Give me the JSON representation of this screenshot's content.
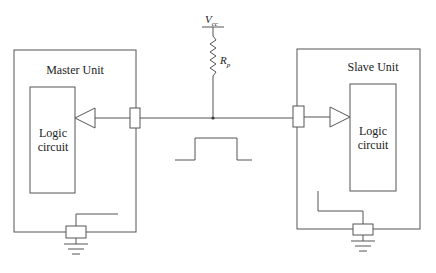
{
  "diagram": {
    "type": "single-wire bus circuit schematic",
    "supply": {
      "label": "V",
      "subscript": "cc"
    },
    "pullup_resistor": {
      "label": "R",
      "subscript": "p"
    },
    "master": {
      "title": "Master Unit",
      "logic_label_line1": "Logic",
      "logic_label_line2": "circuit"
    },
    "slave": {
      "title": "Slave Unit",
      "logic_label_line1": "Logic",
      "logic_label_line2": "circuit"
    },
    "bus_waveform": "single pulse (low-high-low)",
    "colors": {
      "line": "#555555",
      "text": "#222222",
      "background": "#ffffff"
    }
  }
}
